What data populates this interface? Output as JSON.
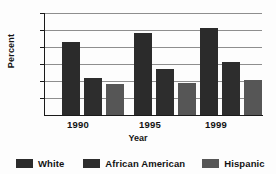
{
  "chart_data": {
    "type": "bar",
    "title": "",
    "xlabel": "Year",
    "ylabel": "Percent",
    "categories": [
      "1990",
      "1995",
      "1999"
    ],
    "series": [
      {
        "name": "White",
        "values": [
          21.5,
          24.0,
          25.5
        ],
        "color": "#2b2b2b"
      },
      {
        "name": "African American",
        "values": [
          11.0,
          13.5,
          15.5
        ],
        "color": "#2d2d2d"
      },
      {
        "name": "Hispanic",
        "values": [
          9.0,
          9.3,
          10.3
        ],
        "color": "#565656"
      }
    ],
    "ylim": [
      0,
      30
    ],
    "ytick_labels": [
      "10",
      "20",
      "30"
    ],
    "ytick_values": [
      10,
      20,
      30
    ],
    "yminor_values": [
      5,
      15,
      25
    ],
    "grid": true,
    "legend_position": "bottom"
  },
  "axes": {
    "y_title": "Percent",
    "x_title": "Year",
    "y_ticks": [
      {
        "label": "30",
        "value": 30
      },
      {
        "label": "20",
        "value": 20
      },
      {
        "label": "10",
        "value": 10
      }
    ]
  },
  "legend": {
    "items": [
      {
        "label": "White"
      },
      {
        "label": "African American"
      },
      {
        "label": "Hispanic"
      }
    ]
  }
}
